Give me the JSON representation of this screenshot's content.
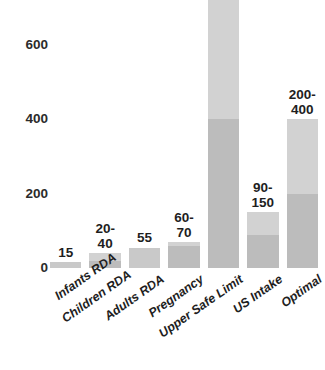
{
  "chart_data": {
    "type": "bar",
    "title": "",
    "xlabel": "",
    "ylabel": "",
    "ylim": [
      0,
      700
    ],
    "yticks": [
      0,
      200,
      400,
      600
    ],
    "ytick_labels": [
      "0",
      "200",
      "400",
      "600"
    ],
    "grid": false,
    "legend": "none",
    "orientation": "vertical",
    "label_rotation": -35,
    "categories": [
      "Infants RDA",
      "Children RDA",
      "Adults RDA",
      "Pregnancy",
      "Upper Safe Limit",
      "US Intake",
      "Optimal"
    ],
    "value_labels": [
      "15",
      "20-\n40",
      "55",
      "60-\n70",
      "400-\n800",
      "90-\n150",
      "200-\n400"
    ],
    "points": [
      {
        "category": "Infants RDA",
        "label": "15",
        "min": 15,
        "max": 15,
        "is_range": false
      },
      {
        "category": "Children RDA",
        "label": "20-\n40",
        "min": 20,
        "max": 40,
        "is_range": true
      },
      {
        "category": "Adults RDA",
        "label": "55",
        "min": 55,
        "max": 55,
        "is_range": false
      },
      {
        "category": "Pregnancy",
        "label": "60-\n70",
        "min": 60,
        "max": 70,
        "is_range": true
      },
      {
        "category": "Upper Safe Limit",
        "label": "400-\n800",
        "min": 400,
        "max": 800,
        "is_range": true
      },
      {
        "category": "US Intake",
        "label": "90-\n150",
        "min": 90,
        "max": 150,
        "is_range": true
      },
      {
        "category": "Optimal",
        "label": "200-\n400",
        "min": 200,
        "max": 400,
        "is_range": true
      }
    ],
    "colors": {
      "bar_max": "#d2d2d2",
      "bar_min": "#bcbcbc",
      "text": "#1e1e1e",
      "background": "#ffffff"
    }
  }
}
